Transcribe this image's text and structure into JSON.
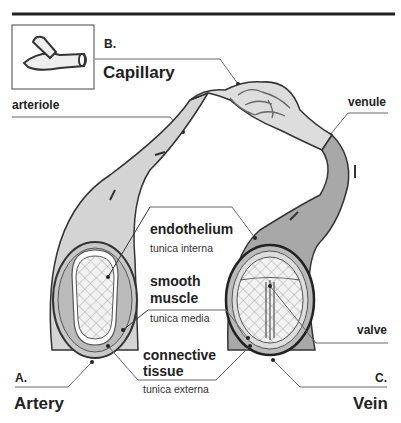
{
  "labels": {
    "b_letter": "B.",
    "capillary": "Capillary",
    "arteriole": "arteriole",
    "venule": "venule",
    "endothelium": "endothelium",
    "tunica_interna": "tunica interna",
    "smooth_muscle_1": "smooth",
    "smooth_muscle_2": "muscle",
    "tunica_media": "tunica media",
    "valve": "valve",
    "connective_1": "connective",
    "connective_2": "tissue",
    "tunica_externa": "tunica externa",
    "a_letter": "A.",
    "artery": "Artery",
    "c_letter": "C.",
    "vein": "Vein"
  },
  "colors": {
    "artery_fill": "#d4d4d4",
    "vein_fill": "#a8a8a8",
    "outline": "#333333",
    "line": "#555555"
  }
}
